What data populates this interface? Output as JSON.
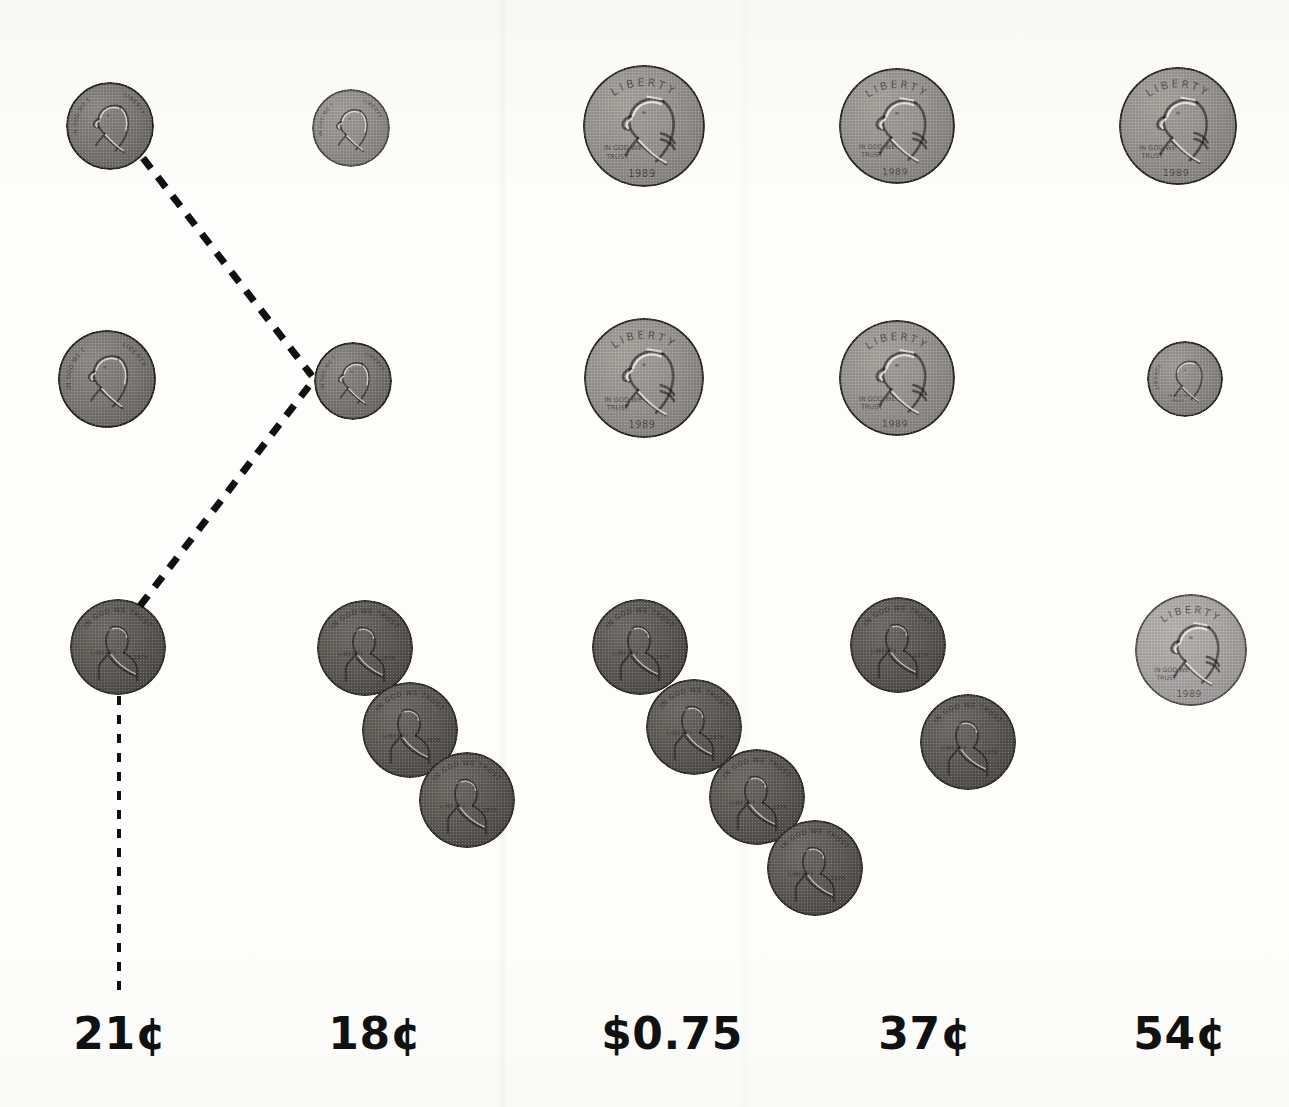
{
  "worksheet": {
    "title": "Coin value worksheet",
    "background_color": "#fdfdfc",
    "label_color": "#111111"
  },
  "columns": [
    {
      "id": "col-1",
      "amount_label": "21¢",
      "label_x": 120
    },
    {
      "id": "col-2",
      "amount_label": "18¢",
      "label_x": 375
    },
    {
      "id": "col-3",
      "amount_label": "$0.75",
      "label_x": 672
    },
    {
      "id": "col-4",
      "amount_label": "37¢",
      "label_x": 925
    },
    {
      "id": "col-5",
      "amount_label": "54¢",
      "label_x": 1180
    }
  ],
  "coins": [
    {
      "name": "coin-nickel",
      "type": "nickel",
      "denomination": "5¢",
      "cx": 110,
      "cy": 126,
      "d": 88,
      "faded": false
    },
    {
      "name": "coin-nickel",
      "type": "nickel",
      "denomination": "5¢",
      "cx": 351,
      "cy": 128,
      "d": 78,
      "faded": true
    },
    {
      "name": "coin-quarter",
      "type": "quarter",
      "denomination": "25¢",
      "cx": 644,
      "cy": 126,
      "d": 122,
      "faded": false
    },
    {
      "name": "coin-quarter",
      "type": "quarter",
      "denomination": "25¢",
      "cx": 897,
      "cy": 126,
      "d": 116,
      "faded": false
    },
    {
      "name": "coin-quarter",
      "type": "quarter",
      "denomination": "25¢",
      "cx": 1178,
      "cy": 126,
      "d": 118,
      "faded": false
    },
    {
      "name": "coin-nickel",
      "type": "nickel",
      "denomination": "5¢",
      "cx": 107,
      "cy": 379,
      "d": 98,
      "faded": false
    },
    {
      "name": "coin-nickel",
      "type": "nickel",
      "denomination": "5¢",
      "cx": 353,
      "cy": 381,
      "d": 78,
      "faded": false
    },
    {
      "name": "coin-quarter",
      "type": "quarter",
      "denomination": "25¢",
      "cx": 644,
      "cy": 378,
      "d": 120,
      "faded": false
    },
    {
      "name": "coin-quarter",
      "type": "quarter",
      "denomination": "25¢",
      "cx": 897,
      "cy": 378,
      "d": 116,
      "faded": false
    },
    {
      "name": "coin-dime",
      "type": "dime",
      "denomination": "10¢",
      "cx": 1185,
      "cy": 379,
      "d": 76,
      "faded": false
    },
    {
      "name": "coin-penny",
      "type": "penny",
      "denomination": "1¢",
      "cx": 118,
      "cy": 647,
      "d": 96,
      "faded": false
    },
    {
      "name": "coin-penny",
      "type": "penny",
      "denomination": "1¢",
      "cx": 365,
      "cy": 648,
      "d": 96,
      "faded": false
    },
    {
      "name": "coin-penny",
      "type": "penny",
      "denomination": "1¢",
      "cx": 410,
      "cy": 730,
      "d": 96,
      "faded": false
    },
    {
      "name": "coin-penny",
      "type": "penny",
      "denomination": "1¢",
      "cx": 467,
      "cy": 800,
      "d": 96,
      "faded": false
    },
    {
      "name": "coin-penny",
      "type": "penny",
      "denomination": "1¢",
      "cx": 640,
      "cy": 647,
      "d": 96,
      "faded": false
    },
    {
      "name": "coin-penny",
      "type": "penny",
      "denomination": "1¢",
      "cx": 694,
      "cy": 727,
      "d": 96,
      "faded": false
    },
    {
      "name": "coin-penny",
      "type": "penny",
      "denomination": "1¢",
      "cx": 757,
      "cy": 797,
      "d": 96,
      "faded": false
    },
    {
      "name": "coin-penny",
      "type": "penny",
      "denomination": "1¢",
      "cx": 815,
      "cy": 868,
      "d": 96,
      "faded": false
    },
    {
      "name": "coin-penny",
      "type": "penny",
      "denomination": "1¢",
      "cx": 898,
      "cy": 645,
      "d": 96,
      "faded": false
    },
    {
      "name": "coin-penny",
      "type": "penny",
      "denomination": "1¢",
      "cx": 968,
      "cy": 742,
      "d": 96,
      "faded": false
    },
    {
      "name": "coin-quarter",
      "type": "quarter",
      "denomination": "25¢",
      "cx": 1191,
      "cy": 650,
      "d": 112,
      "faded": true
    }
  ],
  "connector_lines": [
    {
      "name": "connector-nickel-to-nickel",
      "x1": 143,
      "y1": 158,
      "x2": 312,
      "y2": 376,
      "width": 7
    },
    {
      "name": "connector-penny-to-nickel",
      "x1": 140,
      "y1": 606,
      "x2": 312,
      "y2": 382,
      "width": 7
    },
    {
      "name": "connector-penny-to-answer",
      "x1": 119,
      "y1": 696,
      "x2": 119,
      "y2": 990,
      "width": 4
    }
  ]
}
